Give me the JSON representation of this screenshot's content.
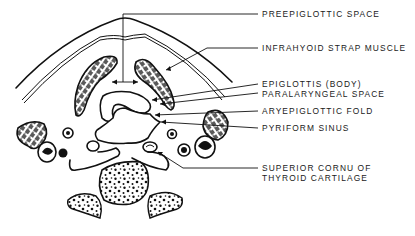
{
  "figure": {
    "type": "anatomical line drawing",
    "ink_color": "#111111",
    "background_color": "#ffffff"
  },
  "labels": [
    {
      "id": "preepiglottic-space",
      "text": "PREEPIGLOTTIC SPACE"
    },
    {
      "id": "infrahyoid-strap-muscle",
      "text": "INFRAHYOID STRAP MUSCLE"
    },
    {
      "id": "epiglottis-body",
      "text": "EPIGLOTTIS (BODY)"
    },
    {
      "id": "paralaryngeal-space",
      "text": "PARALARYNGEAL SPACE"
    },
    {
      "id": "aryepiglottic-fold",
      "text": "ARYEPIGLOTTIC FOLD"
    },
    {
      "id": "pyriform-sinus",
      "text": "PYRIFORM SINUS"
    },
    {
      "id": "superior-cornu-line1",
      "text": "SUPERIOR CORNU OF"
    },
    {
      "id": "superior-cornu-line2",
      "text": "THYROID CARTILAGE"
    }
  ]
}
